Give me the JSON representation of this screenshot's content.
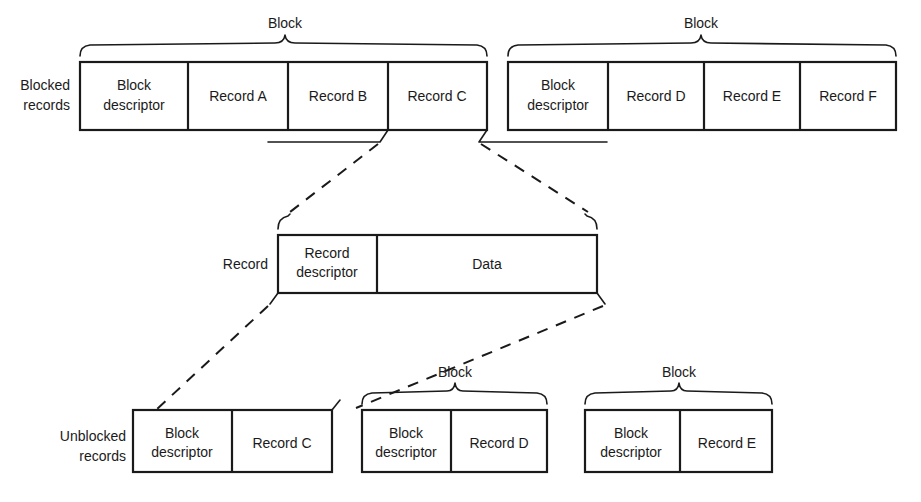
{
  "diagram": {
    "colors": {
      "ink": "#1a1a1a",
      "paper": "#ffffff"
    },
    "row_labels": {
      "blocked_line1": "Blocked",
      "blocked_line2": "records",
      "unblocked_line1": "Unblocked",
      "unblocked_line2": "records",
      "record": "Record"
    },
    "brace_labels": {
      "block": "Block"
    },
    "blocked_row": {
      "label_line1": "Blocked",
      "label_line2": "records",
      "blocks": [
        {
          "brace_label": "Block",
          "cells": [
            {
              "line1": "Block",
              "line2": "descriptor"
            },
            {
              "line1": "Record A",
              "line2": ""
            },
            {
              "line1": "Record B",
              "line2": ""
            },
            {
              "line1": "Record C",
              "line2": ""
            }
          ]
        },
        {
          "brace_label": "Block",
          "cells": [
            {
              "line1": "Block",
              "line2": "descriptor"
            },
            {
              "line1": "Record D",
              "line2": ""
            },
            {
              "line1": "Record E",
              "line2": ""
            },
            {
              "line1": "Record F",
              "line2": ""
            }
          ]
        }
      ]
    },
    "record_detail": {
      "label": "Record",
      "cells": [
        {
          "line1": "Record",
          "line2": "descriptor"
        },
        {
          "line1": "Data",
          "line2": ""
        }
      ]
    },
    "unblocked_row": {
      "label_line1": "Unblocked",
      "label_line2": "records",
      "blocks": [
        {
          "brace_label": "",
          "cells": [
            {
              "line1": "Block",
              "line2": "descriptor"
            },
            {
              "line1": "Record C",
              "line2": ""
            }
          ]
        },
        {
          "brace_label": "Block",
          "cells": [
            {
              "line1": "Block",
              "line2": "descriptor"
            },
            {
              "line1": "Record D",
              "line2": ""
            }
          ]
        },
        {
          "brace_label": "Block",
          "cells": [
            {
              "line1": "Block",
              "line2": "descriptor"
            },
            {
              "line1": "Record E",
              "line2": ""
            }
          ]
        }
      ]
    }
  }
}
